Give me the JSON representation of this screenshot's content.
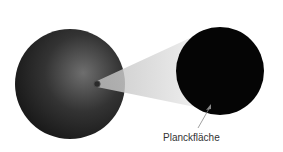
{
  "diagram": {
    "label": "Planckfläche",
    "colors": {
      "sphere_dark": "#1a1a1a",
      "sphere_light": "#6e6e6e",
      "disk": "#050505",
      "cone": "#e6e6e6"
    }
  }
}
